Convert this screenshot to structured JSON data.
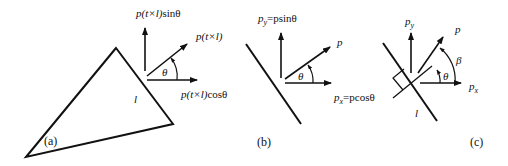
{
  "figure": {
    "panels": [
      {
        "id": "a",
        "caption": "(a)",
        "edge_label": "l",
        "angle_label": "θ",
        "vectors": {
          "resultant": {
            "p": "p",
            "arg": "(t×l)",
            "suffix": ""
          },
          "vertical": {
            "p": "p",
            "arg": "(t×l)",
            "suffix": "sinθ"
          },
          "horizontal": {
            "p": "p",
            "arg": "(t×l)",
            "suffix": "cosθ"
          }
        }
      },
      {
        "id": "b",
        "caption": "(b)",
        "angle_label": "θ",
        "vectors": {
          "resultant": {
            "p": "p"
          },
          "vertical": {
            "p": "p",
            "sub": "y",
            "eq": "=psinθ"
          },
          "horizontal": {
            "p": "p",
            "sub": "x",
            "eq": "=pcosθ"
          }
        }
      },
      {
        "id": "c",
        "caption": "(c)",
        "edge_label": "l",
        "angle_labels": {
          "theta": "θ",
          "beta": "β"
        },
        "vectors": {
          "resultant": {
            "p": "p"
          },
          "vertical": {
            "p": "p",
            "sub": "y"
          },
          "horizontal": {
            "p": "p",
            "sub": "x"
          }
        }
      }
    ],
    "colors": {
      "stroke": "#111111",
      "background": "#ffffff"
    }
  }
}
